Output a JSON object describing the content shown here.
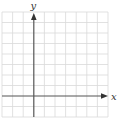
{
  "diagram": {
    "type": "coordinate-grid",
    "x_axis_label": "x",
    "y_axis_label": "y",
    "grid": {
      "columns": 10,
      "rows": 10,
      "origin_column": 3,
      "origin_row_from_top": 8
    },
    "colors": {
      "grid_line": "#d9d9d9",
      "axis_line": "#555555",
      "label": "#333333",
      "background": "#ffffff"
    }
  }
}
